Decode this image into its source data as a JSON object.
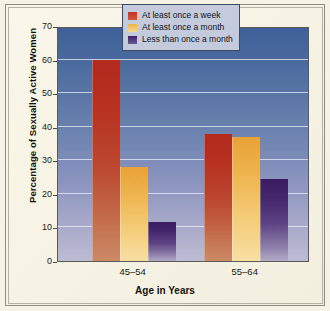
{
  "chart_data": {
    "type": "bar",
    "title": "",
    "subtitle": "",
    "xlabel": "Age in Years",
    "ylabel": "Percentage of Sexually Active Women",
    "categories": [
      "45–54",
      "55–64"
    ],
    "ylim": [
      0,
      70
    ],
    "yticks": [
      0,
      10,
      20,
      30,
      40,
      50,
      60,
      70
    ],
    "ytick_labels": [
      "0",
      "10",
      "20",
      "30",
      "40",
      "50",
      "60",
      "70"
    ],
    "grid": true,
    "legend_position": "top-right",
    "series": [
      {
        "name": "At least once a week",
        "color": "#b22a1d",
        "values": [
          60,
          37.8
        ]
      },
      {
        "name": "At least once a month",
        "color": "#e8a236",
        "values": [
          28,
          36.8
        ]
      },
      {
        "name": "Less than once a month",
        "color": "#3a1c63",
        "values": [
          11.5,
          24.5
        ]
      }
    ]
  },
  "figure": {
    "background_color": "#f6f3e6",
    "plot_background_top": "#3f6199",
    "plot_background_bottom": "#bcbcd3",
    "legend_background": "#c3cbdd"
  }
}
